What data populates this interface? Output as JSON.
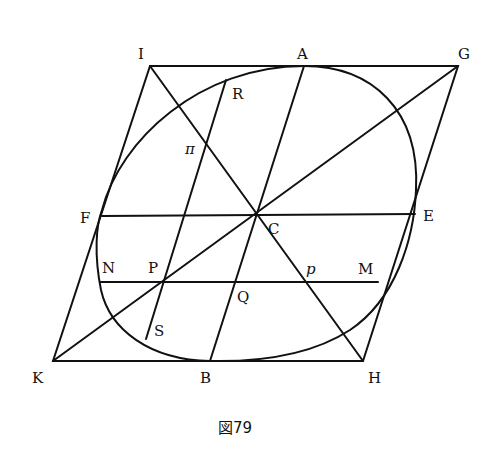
{
  "figure": {
    "caption": "図79",
    "labels": {
      "I": "I",
      "A": "A",
      "G": "G",
      "R": "R",
      "pi": "π",
      "F": "F",
      "C": "C",
      "E": "E",
      "N": "N",
      "P": "P",
      "p": "p",
      "M": "M",
      "Q": "Q",
      "S": "S",
      "K": "K",
      "B": "B",
      "H": "H"
    }
  }
}
